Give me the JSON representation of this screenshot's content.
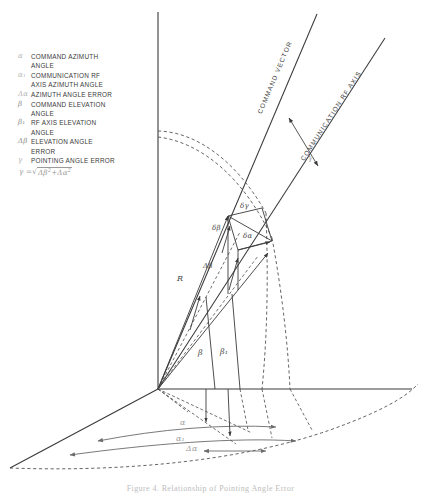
{
  "figure": {
    "caption": "Figure 4. Relationship of Pointing Angle Error"
  },
  "legend": {
    "items": [
      {
        "symbol": "α",
        "faint": true,
        "text": "COMMAND AZIMUTH\nANGLE"
      },
      {
        "symbol": "α₁",
        "faint": true,
        "text": "COMMUNICATION RF\nAXIS AZIMUTH ANGLE"
      },
      {
        "symbol": "Δα",
        "faint": true,
        "text": "AZIMUTH ANGLE ERROR"
      },
      {
        "symbol": "β",
        "faint": false,
        "text": "COMMAND ELEVATION\nANGLE"
      },
      {
        "symbol": "β₁",
        "faint": false,
        "text": "RF AXIS ELEVATION\nANGLE"
      },
      {
        "symbol": "Δβ",
        "faint": false,
        "text": "ELEVATION ANGLE\nERROR"
      },
      {
        "symbol": "γ",
        "faint": true,
        "text": "POINTING ANGLE ERROR"
      }
    ],
    "formula": {
      "lhs": "γ =",
      "radical": "√",
      "term1": "Δβ",
      "term1_exp": "2",
      "plus": "+",
      "term2": "Δα",
      "term2_exp": "2"
    }
  },
  "diagram": {
    "axis_labels": {
      "command_vector": "COMMAND VECTOR",
      "rf_axis": "COMMUNICATION RF AXIS"
    },
    "angle_labels": {
      "gamma": "γ",
      "delta_gamma": "δγ",
      "delta_beta": "δβ",
      "delta_alpha": "δα",
      "big_delta_beta": "Δβ",
      "big_delta_alpha": "Δα",
      "range": "R",
      "beta": "β",
      "beta_one": "β₁",
      "alpha": "α",
      "alpha_one": "α₁"
    },
    "colors": {
      "line": "#3a3a3a",
      "dashed": "#4a4a4a",
      "faint": "#9e9e9e",
      "background": "#ffffff"
    }
  }
}
